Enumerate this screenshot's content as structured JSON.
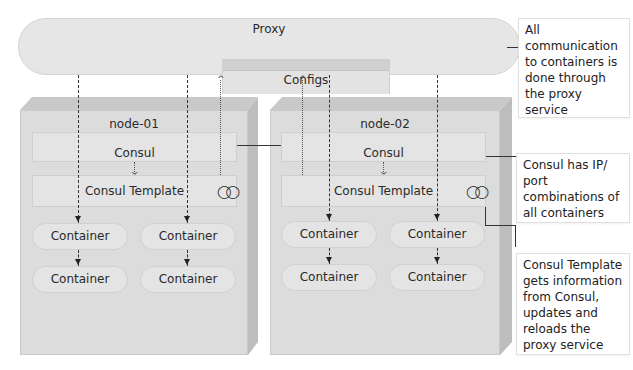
{
  "proxy": {
    "label": "Proxy",
    "configs_label": "Configs"
  },
  "nodes": [
    {
      "label": "node-01",
      "consul_label": "Consul",
      "template_label": "Consul Template",
      "template_icon": "rings-icon",
      "containers": [
        "Container",
        "Container",
        "Container",
        "Container"
      ]
    },
    {
      "label": "node-02",
      "consul_label": "Consul",
      "template_label": "Consul Template",
      "template_icon": "rings-icon",
      "containers": [
        "Container",
        "Container",
        "Container",
        "Container"
      ]
    }
  ],
  "callouts": {
    "proxy_note": "All communication to containers is done through the proxy service",
    "consul_note": "Consul has IP/ port combinations of all containers",
    "template_note": "Consul Template gets information from Consul, updates and reloads the proxy service"
  },
  "icons": {
    "rings_glyph": "◯◯"
  },
  "colors": {
    "node_face": "#dcdcdc",
    "node_top": "#c9c9c9",
    "node_side": "#bdbdbd",
    "element": "#e4e4e4",
    "line": "#333333"
  }
}
